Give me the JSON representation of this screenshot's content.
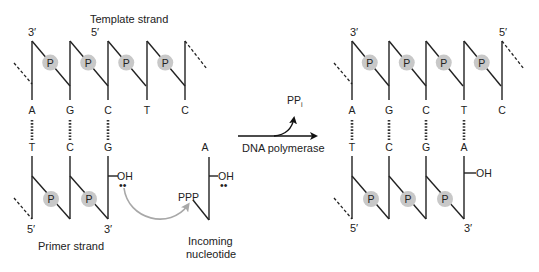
{
  "labels": {
    "template_strand": "Template strand",
    "primer_strand": "Primer strand",
    "incoming_line1": "Incoming",
    "incoming_line2": "nucleotide",
    "enzyme": "DNA polymerase",
    "released": "PP",
    "released_sub": "i",
    "three_prime": "3′",
    "five_prime": "5′",
    "phosphate": "P",
    "hydroxyl": "OH",
    "triphosphate": "PPP",
    "lone_pair": "••"
  },
  "before": {
    "template_bases": [
      "A",
      "G",
      "C",
      "T",
      "C"
    ],
    "primer_bases": [
      "T",
      "C",
      "G"
    ],
    "incoming_base": "A"
  },
  "after": {
    "template_bases": [
      "A",
      "G",
      "C",
      "T",
      "C"
    ],
    "primer_bases": [
      "T",
      "C",
      "G",
      "A"
    ]
  },
  "colors": {
    "line": "#222222",
    "phosphate_fill": "#c8c8c8",
    "curved_arrow": "#a8a8a8"
  }
}
